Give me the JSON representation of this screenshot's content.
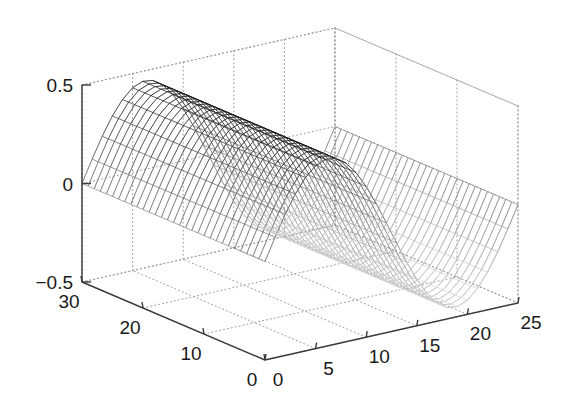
{
  "figure": {
    "background_color": "#ffffff",
    "type": "matlab-mesh-3d-surface",
    "width": 567,
    "height": 406
  },
  "chart_data": {
    "type": "surface",
    "title": "",
    "subtitle": "",
    "xlabel": "",
    "ylabel": "",
    "zlabel": "",
    "legend": [],
    "annotations": [],
    "grid": true,
    "grid_style": "dotted",
    "projection": "3d-orthographic",
    "render_style": "wireframe-mesh",
    "colormap": "grayscale",
    "surface_function": "z = 0.45 * sin(2*pi*x/25)",
    "axes": {
      "x": {
        "label": "",
        "min": 0,
        "max": 25,
        "tick_values": [
          0,
          5,
          10,
          15,
          20,
          25
        ],
        "tick_labels": [
          "0",
          "5",
          "10",
          "15",
          "20",
          "25"
        ],
        "direction": "front-right",
        "samples": 26
      },
      "y": {
        "label": "",
        "min": 0,
        "max": 30,
        "tick_values": [
          0,
          10,
          20,
          30
        ],
        "tick_labels": [
          "0",
          "10",
          "20",
          "30"
        ],
        "direction": "front-left",
        "reversed": true,
        "samples": 31
      },
      "z": {
        "label": "",
        "min": -0.5,
        "max": 0.5,
        "tick_values": [
          -0.5,
          0,
          0.5
        ],
        "tick_labels": [
          "-0.5",
          "0",
          "0.5"
        ],
        "direction": "vertical"
      }
    },
    "surface_extrema": {
      "z_max": 0.45,
      "z_max_at_x": 6.25,
      "z_min": -0.45,
      "z_min_at_x": 18.75
    },
    "colors": {
      "axis_line": "#3a3a3a",
      "grid_line": "#9a9a9a",
      "mesh_dark": "#1a1a1a",
      "mesh_light": "#d8d8d8",
      "tick_text": "#1a1a1a",
      "background": "#ffffff"
    }
  },
  "labels": {
    "z": [
      "0.5",
      "0",
      "-0.5"
    ],
    "y": [
      "30",
      "20",
      "10",
      "0"
    ],
    "x": [
      "0",
      "5",
      "10",
      "15",
      "20",
      "25"
    ]
  }
}
